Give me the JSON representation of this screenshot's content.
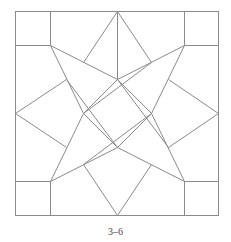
{
  "figure": {
    "caption": "3–6",
    "stroke_color": "#8a8a8a",
    "background": "#ffffff"
  },
  "geometry": {
    "outer_square": {
      "x1": 15,
      "y1": 11,
      "x2": 218,
      "y2": 215
    },
    "lines": [
      [
        50,
        11,
        50,
        45
      ],
      [
        15,
        45,
        50,
        45
      ],
      [
        184,
        11,
        184,
        45
      ],
      [
        184,
        45,
        218,
        45
      ],
      [
        15,
        181,
        50,
        181
      ],
      [
        50,
        181,
        50,
        215
      ],
      [
        184,
        181,
        218,
        181
      ],
      [
        184,
        181,
        184,
        215
      ],
      [
        117,
        11,
        117,
        79
      ],
      [
        117,
        11,
        83,
        62
      ],
      [
        117,
        11,
        151,
        62
      ],
      [
        15,
        113,
        66,
        79
      ],
      [
        15,
        113,
        66,
        147
      ],
      [
        218,
        113,
        168,
        79
      ],
      [
        218,
        113,
        168,
        147
      ],
      [
        117,
        215,
        83,
        164
      ],
      [
        117,
        215,
        151,
        164
      ],
      [
        50,
        45,
        117,
        79
      ],
      [
        184,
        45,
        117,
        79
      ],
      [
        50,
        45,
        83,
        113
      ],
      [
        184,
        45,
        151,
        113
      ],
      [
        50,
        181,
        83,
        113
      ],
      [
        184,
        181,
        151,
        113
      ],
      [
        50,
        181,
        117,
        147
      ],
      [
        184,
        181,
        117,
        147
      ],
      [
        117,
        79,
        151,
        113
      ],
      [
        151,
        113,
        117,
        147
      ],
      [
        117,
        147,
        83,
        113
      ],
      [
        83,
        113,
        117,
        79
      ],
      [
        117,
        79,
        168,
        147
      ],
      [
        117,
        147,
        66,
        79
      ],
      [
        151,
        113,
        83,
        164
      ],
      [
        83,
        113,
        151,
        62
      ]
    ]
  }
}
